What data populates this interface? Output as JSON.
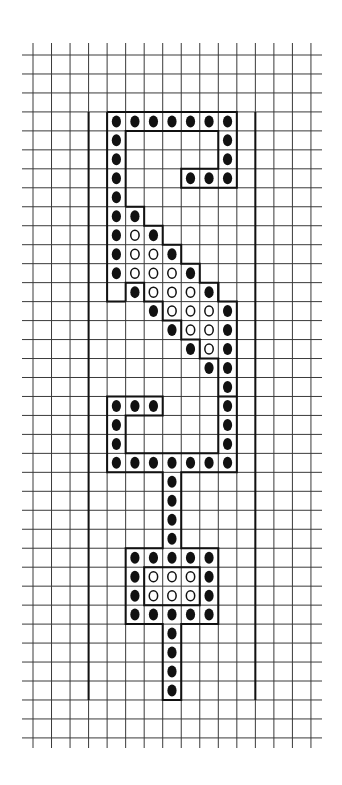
{
  "colors": {
    "background": "#ffffff",
    "grid_line": "#3a3a3a",
    "outline": "#111111",
    "filled_dot": "#111111",
    "open_dot_stroke": "#111111"
  },
  "grid": {
    "columns": 15,
    "rows": 36,
    "origin_x": 33,
    "origin_y": 55,
    "cell_w": 18.53,
    "cell_h": 18.97,
    "h_line_extent": [
      22,
      322
    ],
    "v_line_extent": [
      43,
      748
    ]
  },
  "frame": {
    "left_edge_col": 3,
    "right_edge_col": 12,
    "top_row": 3,
    "bottom_row": 34
  },
  "legend": {
    "filled": "filled dot (dark stitch/bead)",
    "open": "open circle (light stitch/bead)"
  },
  "pattern": {
    "filled": [
      [
        3,
        4
      ],
      [
        3,
        5
      ],
      [
        3,
        6
      ],
      [
        3,
        7
      ],
      [
        3,
        8
      ],
      [
        3,
        9
      ],
      [
        3,
        10
      ],
      [
        4,
        4
      ],
      [
        4,
        10
      ],
      [
        5,
        4
      ],
      [
        5,
        10
      ],
      [
        6,
        4
      ],
      [
        6,
        8
      ],
      [
        6,
        9
      ],
      [
        6,
        10
      ],
      [
        7,
        4
      ],
      [
        8,
        4
      ],
      [
        8,
        5
      ],
      [
        9,
        4
      ],
      [
        9,
        6
      ],
      [
        10,
        4
      ],
      [
        10,
        7
      ],
      [
        11,
        4
      ],
      [
        11,
        8
      ],
      [
        12,
        5
      ],
      [
        12,
        9
      ],
      [
        13,
        6
      ],
      [
        13,
        10
      ],
      [
        14,
        7
      ],
      [
        14,
        10
      ],
      [
        15,
        8
      ],
      [
        15,
        10
      ],
      [
        16,
        9
      ],
      [
        16,
        10
      ],
      [
        17,
        10
      ],
      [
        18,
        4
      ],
      [
        18,
        5
      ],
      [
        18,
        6
      ],
      [
        18,
        10
      ],
      [
        19,
        4
      ],
      [
        19,
        10
      ],
      [
        20,
        4
      ],
      [
        20,
        10
      ],
      [
        21,
        4
      ],
      [
        21,
        5
      ],
      [
        21,
        6
      ],
      [
        21,
        7
      ],
      [
        21,
        8
      ],
      [
        21,
        9
      ],
      [
        21,
        10
      ],
      [
        22,
        7
      ],
      [
        23,
        7
      ],
      [
        24,
        7
      ],
      [
        25,
        7
      ],
      [
        26,
        5
      ],
      [
        26,
        6
      ],
      [
        26,
        7
      ],
      [
        26,
        8
      ],
      [
        26,
        9
      ],
      [
        27,
        5
      ],
      [
        27,
        9
      ],
      [
        28,
        5
      ],
      [
        28,
        9
      ],
      [
        29,
        5
      ],
      [
        29,
        6
      ],
      [
        29,
        7
      ],
      [
        29,
        8
      ],
      [
        29,
        9
      ],
      [
        30,
        7
      ],
      [
        31,
        7
      ],
      [
        32,
        7
      ],
      [
        33,
        7
      ]
    ],
    "open": [
      [
        9,
        5
      ],
      [
        10,
        5
      ],
      [
        10,
        6
      ],
      [
        11,
        5
      ],
      [
        11,
        6
      ],
      [
        11,
        7
      ],
      [
        12,
        6
      ],
      [
        12,
        7
      ],
      [
        12,
        8
      ],
      [
        13,
        7
      ],
      [
        13,
        8
      ],
      [
        13,
        9
      ],
      [
        14,
        8
      ],
      [
        14,
        9
      ],
      [
        15,
        9
      ],
      [
        27,
        6
      ],
      [
        27,
        7
      ],
      [
        27,
        8
      ],
      [
        28,
        6
      ],
      [
        28,
        7
      ],
      [
        28,
        8
      ]
    ]
  },
  "outline_paths": [
    "M4,3 H11 V7 H8 V6 H10 V4 H5 V8",
    "M4,3 V13 H5",
    "M5,8 H6 V9 H7 V10 H8 V11 H9 V12 H10 V13 H11 V18 H10 V16 H9 V15 H8 V14 H7 V13 H6 V12 H5 V13",
    "M10,12 V13",
    "M11,18 V22 H8 V26 H10 V30 H8 V34 H7 V30 H5 V26 H7 V22 H4 V18 H7 V19 H5 V21 H10 V18",
    "M6,27 H9 V29 H6 Z"
  ],
  "footer_mark": ""
}
